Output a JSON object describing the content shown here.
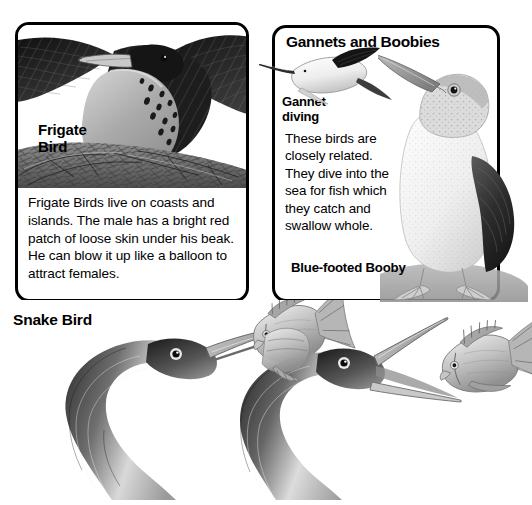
{
  "page": {
    "background_color": "#ffffff",
    "ink_color": "#000000",
    "width": 532,
    "height": 505
  },
  "panels": {
    "frigate": {
      "label": "Frigate\nBird",
      "label_name": "frigate-bird-label",
      "body_text": "Frigate Birds live on coasts and islands. The male has a bright red patch of loose skin under his beak. He can blow it up like a balloon to attract females.",
      "illustration_name": "frigate-bird-on-nest-illustration",
      "border_color": "#000000"
    },
    "gannets": {
      "title": "Gannets and Boobies",
      "diving_label": "Gannet\ndiving",
      "body_text": "These birds are closely related. They dive into the sea for fish which they catch and swallow whole.",
      "booby_caption": "Blue-footed Booby",
      "diving_illustration_name": "gannet-diving-illustration",
      "booby_illustration_name": "blue-footed-booby-illustration",
      "border_color": "#000000"
    }
  },
  "snake_bird": {
    "heading": "Snake Bird",
    "illustration_name": "snake-bird-with-fish-illustration",
    "figure_count": 2,
    "subjects": [
      "anhinga head and neck spearing fish",
      "anhinga head and neck with fish at beak tip"
    ]
  }
}
